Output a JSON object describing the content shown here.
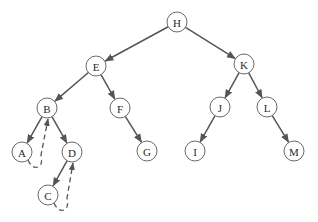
{
  "diagram": {
    "type": "threaded binary tree",
    "node_radius": 10,
    "colors": {
      "stroke": "#6a6a6a",
      "edge": "#555555",
      "text": "#2a2a2a",
      "background": "#ffffff"
    },
    "nodes": [
      {
        "id": "H",
        "label": "H",
        "x": 177,
        "y": 22
      },
      {
        "id": "E",
        "label": "E",
        "x": 96,
        "y": 66
      },
      {
        "id": "K",
        "label": "K",
        "x": 244,
        "y": 64
      },
      {
        "id": "B",
        "label": "B",
        "x": 47,
        "y": 108
      },
      {
        "id": "F",
        "label": "F",
        "x": 120,
        "y": 108
      },
      {
        "id": "J",
        "label": "J",
        "x": 220,
        "y": 107
      },
      {
        "id": "L",
        "label": "L",
        "x": 267,
        "y": 107
      },
      {
        "id": "A",
        "label": "A",
        "x": 22,
        "y": 152
      },
      {
        "id": "D",
        "label": "D",
        "x": 72,
        "y": 152
      },
      {
        "id": "G",
        "label": "G",
        "x": 147,
        "y": 151
      },
      {
        "id": "I",
        "label": "I",
        "x": 195,
        "y": 151
      },
      {
        "id": "M",
        "label": "M",
        "x": 294,
        "y": 151
      },
      {
        "id": "C",
        "label": "C",
        "x": 48,
        "y": 195
      }
    ],
    "edges": [
      {
        "from": "H",
        "to": "E"
      },
      {
        "from": "H",
        "to": "K"
      },
      {
        "from": "E",
        "to": "B"
      },
      {
        "from": "E",
        "to": "F"
      },
      {
        "from": "K",
        "to": "J"
      },
      {
        "from": "K",
        "to": "L"
      },
      {
        "from": "B",
        "to": "A"
      },
      {
        "from": "B",
        "to": "D"
      },
      {
        "from": "F",
        "to": "G"
      },
      {
        "from": "J",
        "to": "I"
      },
      {
        "from": "L",
        "to": "M"
      },
      {
        "from": "D",
        "to": "C"
      }
    ],
    "threads": [
      {
        "from": "A",
        "to": "B",
        "style": "dashed"
      },
      {
        "from": "C",
        "to": "D",
        "style": "dashed"
      }
    ]
  }
}
